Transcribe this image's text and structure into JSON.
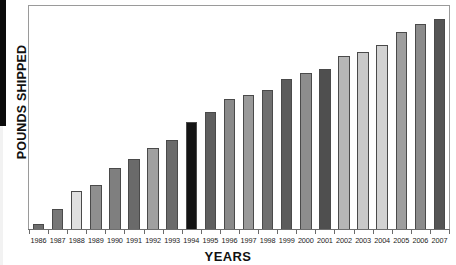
{
  "chart_data": {
    "type": "bar",
    "title": "",
    "xlabel": "YEARS",
    "ylabel": "POUNDS SHIPPED",
    "grid": false,
    "legend": false,
    "axis_tick_labels_y": [],
    "ylim": [
      0,
      100
    ],
    "categories": [
      "1986",
      "1987",
      "1988",
      "1989",
      "1990",
      "1991",
      "1992",
      "1993",
      "1994",
      "1995",
      "1996",
      "1997",
      "1998",
      "1999",
      "2000",
      "2001",
      "2002",
      "2003",
      "2004",
      "2005",
      "2006",
      "2007"
    ],
    "values": [
      3,
      10,
      18,
      21,
      29,
      33,
      38,
      42,
      50,
      55,
      61,
      63,
      65,
      70,
      73,
      75,
      81,
      83,
      86,
      92,
      96,
      98
    ],
    "bar_colors": [
      "#6e6e6e",
      "#777777",
      "#e0e0e0",
      "#8f8f8f",
      "#7f7f7f",
      "#6a6a6a",
      "#a0a0a0",
      "#6b6b6b",
      "#141414",
      "#5f5f5f",
      "#8a8a8a",
      "#9a9a9a",
      "#6f6f6f",
      "#5c5c5c",
      "#8d8d8d",
      "#4f4f4f",
      "#b6b6b6",
      "#c9c9c9",
      "#d2d2d2",
      "#9e9e9e",
      "#8b8b8b",
      "#555555"
    ],
    "bar_outline_color": "#4a4a4a",
    "frame_color": "#9a9a9a"
  },
  "axes": {
    "y_title": "POUNDS SHIPPED",
    "x_title": "YEARS"
  }
}
